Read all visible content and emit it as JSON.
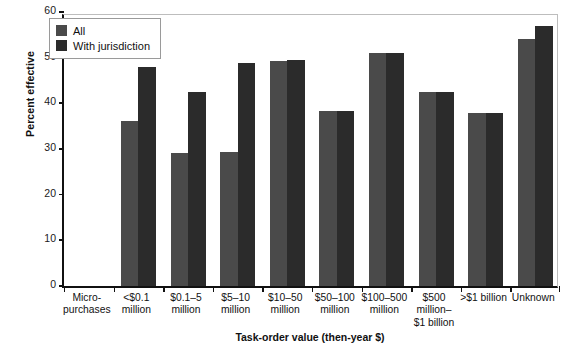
{
  "chart_data": {
    "type": "bar",
    "title": "",
    "xlabel": "Task-order value (then-year $)",
    "ylabel": "Percent effective",
    "ylim": [
      0,
      60
    ],
    "yticks": [
      0,
      10,
      20,
      30,
      40,
      50,
      60
    ],
    "grid": false,
    "legend_position": "top-left",
    "categories": [
      "Micro-\npurchases",
      "<$0.1\nmillion",
      "$0.1–5\nmillion",
      "$5–10\nmillion",
      "$10–50\nmillion",
      "$50–100\nmillion",
      "$100–500\nmillion",
      "$500\nmillion–\n$1 billion",
      ">$1 billion",
      "Unknown"
    ],
    "series": [
      {
        "name": "All",
        "color": "#4a4a4a",
        "values": [
          null,
          36.1,
          29.2,
          29.3,
          49.3,
          38.3,
          51.0,
          42.4,
          37.9,
          54.0
        ]
      },
      {
        "name": "With jurisdiction",
        "color": "#2b2b2b",
        "values": [
          null,
          48.0,
          42.4,
          48.9,
          49.5,
          38.3,
          51.0,
          42.4,
          37.9,
          57.0
        ]
      }
    ]
  },
  "legend": {
    "items": [
      {
        "label": "All",
        "swatch": "legend-swatch-all"
      },
      {
        "label": "With jurisdiction",
        "swatch": "legend-swatch-with-jurisdiction"
      }
    ]
  },
  "axes": {
    "y_title": "Percent effective",
    "x_title": "Task-order value (then-year $)",
    "y_tick_labels": [
      "0",
      "10",
      "20",
      "30",
      "40",
      "50",
      "60"
    ],
    "x_tick_labels": [
      [
        "Micro-",
        "purchases"
      ],
      [
        "<$0.1",
        "million"
      ],
      [
        "$0.1–5",
        "million"
      ],
      [
        "$5–10",
        "million"
      ],
      [
        "$10–50",
        "million"
      ],
      [
        "$50–100",
        "million"
      ],
      [
        "$100–500",
        "million"
      ],
      [
        "$500",
        "million–",
        "$1 billion"
      ],
      [
        ">$1 billion"
      ],
      [
        "Unknown"
      ]
    ]
  },
  "colors": {
    "all": "#4a4a4a",
    "with_jurisdiction": "#2b2b2b",
    "axis": "#111111",
    "frame": "#bdbdbd",
    "background": "#ffffff"
  }
}
